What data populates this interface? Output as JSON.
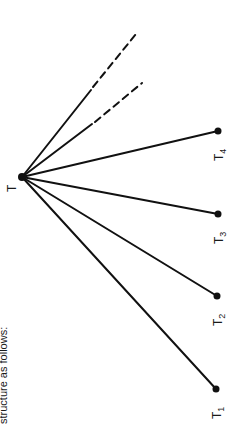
{
  "caption": "structure as follows:",
  "diagram": {
    "hub": {
      "label": "T",
      "x": 22,
      "y": 177
    },
    "terminals": [
      {
        "label": "T",
        "sub": "1",
        "x": 216,
        "y": 389
      },
      {
        "label": "T",
        "sub": "2",
        "x": 217,
        "y": 296
      },
      {
        "label": "T",
        "sub": "3",
        "x": 218,
        "y": 214
      },
      {
        "label": "T",
        "sub": "4",
        "x": 218,
        "y": 131
      }
    ],
    "dashed_branches": [
      {
        "solid_to": [
          91,
          90
        ],
        "dashed_to": [
          136,
          34
        ]
      },
      {
        "solid_to": [
          92,
          124
        ],
        "dashed_to": [
          142,
          83
        ]
      }
    ],
    "line_color": "#111111"
  }
}
